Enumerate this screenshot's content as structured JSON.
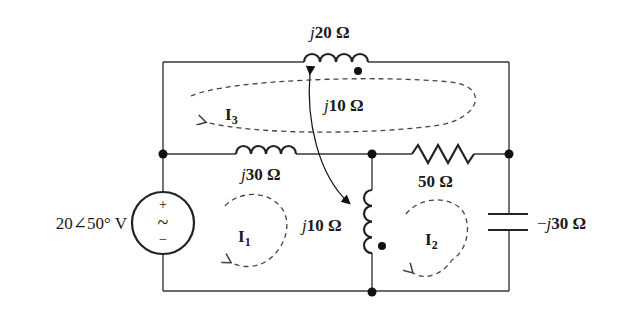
{
  "diagram": {
    "type": "circuit-schematic",
    "source": {
      "label": "20∠50° V",
      "plus": "+",
      "minus": "−",
      "symbol": "~"
    },
    "components": {
      "top_inductor": {
        "label_j": "j",
        "label_val": "20 Ω"
      },
      "mid_inductor": {
        "label_j": "j",
        "label_val": "30 Ω"
      },
      "resistor": {
        "label": "50 Ω"
      },
      "vertical_inductor": {
        "label_j": "j",
        "label_val": "10 Ω"
      },
      "capacitor": {
        "label_pre": "−",
        "label_j": "j",
        "label_val": "30 Ω"
      },
      "mutual": {
        "label_j": "j",
        "label_val": "10 Ω"
      }
    },
    "meshes": [
      {
        "name": "I",
        "sub": "1"
      },
      {
        "name": "I",
        "sub": "2"
      },
      {
        "name": "I",
        "sub": "3"
      }
    ]
  }
}
